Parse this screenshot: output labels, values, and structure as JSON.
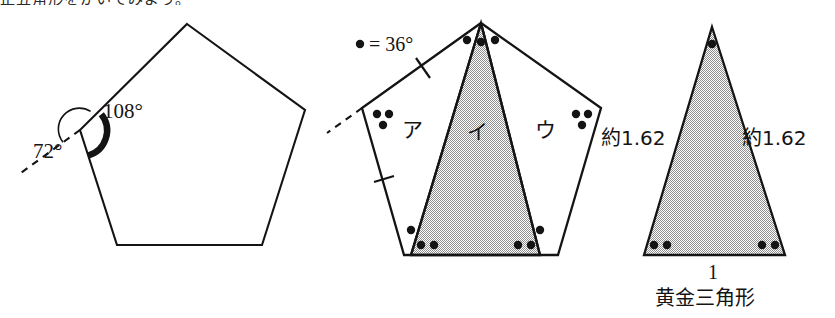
{
  "figure": {
    "caption_top_clipped": "正五角形をかいてみよう。",
    "background_color": "#ffffff",
    "stroke_color": "#141414",
    "shade_fill": "#a8a8a8",
    "panels": [
      {
        "id": "panel-left",
        "name": "regular-pentagon-angles",
        "shape": "pentagon",
        "labels": [
          {
            "name": "interior-angle-label",
            "text": "108°"
          },
          {
            "name": "exterior-angle-label",
            "text": "72°"
          }
        ],
        "annotations": [
          {
            "name": "interior-angle-arc",
            "kind": "thick-arc",
            "value": 108
          },
          {
            "name": "exterior-angle-arc",
            "kind": "thin-arc",
            "value": 72
          },
          {
            "name": "extension-dashed-line",
            "kind": "dashed-ray"
          }
        ]
      },
      {
        "id": "panel-middle",
        "name": "pentagon-decomposition",
        "shape": "pentagon-split-into-three-triangles",
        "legend": {
          "name": "dot-legend",
          "text": "• = 36°",
          "dot_value": 36
        },
        "region_labels": [
          {
            "name": "region-label-a",
            "text": "ア"
          },
          {
            "name": "region-label-b",
            "text": "イ",
            "shaded": true
          },
          {
            "name": "region-label-c",
            "text": "ウ"
          }
        ],
        "dot_marks": [
          {
            "name": "apex-dots",
            "count": 3,
            "angle": 108
          },
          {
            "name": "left-vertex-dots",
            "count": 3,
            "angle": 108
          },
          {
            "name": "right-vertex-dots",
            "count": 3,
            "angle": 108
          },
          {
            "name": "base-left-outer-dot",
            "count": 1,
            "angle": 36
          },
          {
            "name": "base-left-inner-dots",
            "count": 2,
            "angle": 72
          },
          {
            "name": "base-right-inner-dots",
            "count": 2,
            "angle": 72
          },
          {
            "name": "base-right-outer-dot",
            "count": 1,
            "angle": 36
          }
        ],
        "tick_marks": [
          {
            "name": "tick-upper-left-edge",
            "count": 1
          },
          {
            "name": "tick-lower-left-edge",
            "count": 1
          }
        ],
        "annotations": [
          {
            "name": "extension-dashed-line",
            "kind": "dashed-ray"
          }
        ]
      },
      {
        "id": "panel-right",
        "name": "golden-triangle",
        "shape": "isosceles-triangle",
        "shaded": true,
        "caption": {
          "name": "golden-triangle-caption",
          "text": "黄金三角形"
        },
        "side_labels": [
          {
            "name": "left-side-length",
            "text": "約1.62"
          },
          {
            "name": "right-side-length",
            "text": "約1.62"
          },
          {
            "name": "base-length",
            "text": "1"
          }
        ],
        "dot_marks": [
          {
            "name": "apex-dot",
            "count": 1,
            "angle": 36
          },
          {
            "name": "base-left-dots",
            "count": 2,
            "angle": 72
          },
          {
            "name": "base-right-dots",
            "count": 2,
            "angle": 72
          }
        ]
      }
    ]
  }
}
